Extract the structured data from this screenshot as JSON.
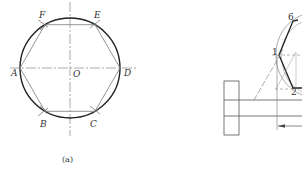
{
  "figure_a": {
    "caption": "(a)",
    "center_label": "O",
    "vertices": [
      {
        "id": "A",
        "label": "A"
      },
      {
        "id": "B",
        "label": "B"
      },
      {
        "id": "C",
        "label": "C"
      },
      {
        "id": "D",
        "label": "D"
      },
      {
        "id": "E",
        "label": "E"
      },
      {
        "id": "F",
        "label": "F"
      }
    ],
    "shape": "regular hexagon inscribed in circle"
  },
  "figure_b": {
    "point_labels": [
      "1",
      "2",
      "6"
    ],
    "parts": [
      "flange",
      "shaft",
      "hexagon construction",
      "dimension arrow"
    ]
  },
  "colors": {
    "stroke_dark": "#222222",
    "stroke_light": "#888888",
    "background": "#ffffff"
  }
}
